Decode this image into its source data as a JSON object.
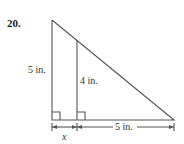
{
  "problem": {
    "number": "20.",
    "labels": {
      "outer_height": "5 in.",
      "inner_height": "4 in.",
      "base_right": "5 in.",
      "base_left": "x"
    }
  },
  "diagram": {
    "type": "similar right triangles",
    "outer_triangle": {
      "vertices": [
        [
          52,
          20
        ],
        [
          52,
          120
        ],
        [
          174,
          120
        ]
      ]
    },
    "inner_segment": {
      "from": [
        77,
        40
      ],
      "to": [
        77,
        120
      ]
    },
    "stroke_color": "#555555"
  }
}
